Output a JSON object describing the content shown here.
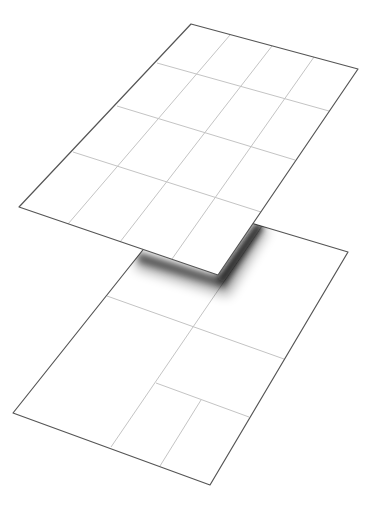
{
  "diagram": {
    "title": "Two stacked layers: uniform grid over subdivided layout",
    "colors": {
      "background": "#ffffff",
      "plane_fill": "#ffffff",
      "plane_edge": "#555555",
      "grid_line": "#c4c4c4",
      "shadow": "#000000"
    },
    "top_plane": {
      "name": "uniform-grid-layer",
      "columns": 4,
      "rows": 4,
      "corners": {
        "top_left": [
          191,
          24
        ],
        "top_right": [
          358,
          69
        ],
        "bottom_right": [
          218,
          275
        ],
        "bottom_left": [
          19,
          207
        ]
      }
    },
    "bottom_plane": {
      "name": "subdivided-layout-layer",
      "regions": 5,
      "corners": {
        "top_left": [
          181,
          202
        ],
        "top_right": [
          348,
          252
        ],
        "bottom_right": [
          210,
          485
        ],
        "bottom_left": [
          13,
          413
        ]
      }
    }
  }
}
